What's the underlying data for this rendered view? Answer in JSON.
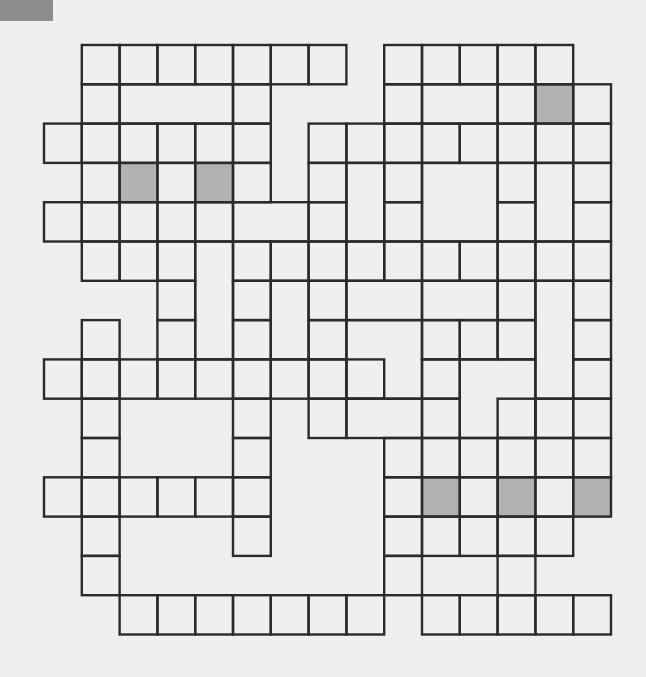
{
  "puzzle": {
    "type": "crossword-grid",
    "origin": [
      44,
      45
    ],
    "cell_w": 37.8,
    "cell_h": 39.3,
    "colors": {
      "background": "#efefed",
      "cell": "#efefed",
      "shaded": "#b2b2b2",
      "line": "#2b2b2b",
      "corner_block": "#8d8d8d"
    },
    "boxes": [
      [
        1,
        0
      ],
      [
        2,
        0
      ],
      [
        3,
        0
      ],
      [
        4,
        0
      ],
      [
        5,
        0
      ],
      [
        6,
        0
      ],
      [
        7,
        0
      ],
      [
        9,
        0
      ],
      [
        10,
        0
      ],
      [
        11,
        0
      ],
      [
        12,
        0
      ],
      [
        13,
        0
      ],
      [
        1,
        1
      ],
      [
        2,
        1,
        3,
        1
      ],
      [
        5,
        1
      ],
      [
        9,
        1
      ],
      [
        10,
        1,
        2,
        1
      ],
      [
        12,
        1
      ],
      [
        13,
        1
      ],
      [
        14,
        1
      ],
      [
        0,
        2
      ],
      [
        1,
        2
      ],
      [
        2,
        2
      ],
      [
        3,
        2
      ],
      [
        4,
        2
      ],
      [
        5,
        2
      ],
      [
        7,
        2
      ],
      [
        8,
        2
      ],
      [
        9,
        2
      ],
      [
        10,
        2
      ],
      [
        11,
        2
      ],
      [
        12,
        2
      ],
      [
        13,
        2
      ],
      [
        14,
        2
      ],
      [
        1,
        3
      ],
      [
        2,
        3
      ],
      [
        3,
        3
      ],
      [
        4,
        3
      ],
      [
        5,
        3
      ],
      [
        7,
        3
      ],
      [
        8,
        3,
        1,
        2
      ],
      [
        9,
        3
      ],
      [
        10,
        3,
        2,
        2
      ],
      [
        12,
        3
      ],
      [
        13,
        3,
        1,
        2
      ],
      [
        14,
        3
      ],
      [
        0,
        4
      ],
      [
        1,
        4
      ],
      [
        2,
        4
      ],
      [
        3,
        4
      ],
      [
        4,
        4
      ],
      [
        5,
        4,
        2,
        1
      ],
      [
        7,
        4
      ],
      [
        9,
        4
      ],
      [
        12,
        4
      ],
      [
        14,
        4
      ],
      [
        1,
        5
      ],
      [
        2,
        5
      ],
      [
        3,
        5
      ],
      [
        4,
        5,
        1,
        3
      ],
      [
        5,
        5
      ],
      [
        6,
        5
      ],
      [
        7,
        5
      ],
      [
        8,
        5
      ],
      [
        9,
        5
      ],
      [
        10,
        5
      ],
      [
        11,
        5
      ],
      [
        12,
        5
      ],
      [
        13,
        5
      ],
      [
        14,
        5
      ],
      [
        3,
        6
      ],
      [
        5,
        6
      ],
      [
        6,
        6,
        1,
        2
      ],
      [
        7,
        6
      ],
      [
        8,
        6,
        2,
        1
      ],
      [
        10,
        6,
        2,
        1
      ],
      [
        12,
        6
      ],
      [
        13,
        6,
        1,
        3
      ],
      [
        14,
        6
      ],
      [
        1,
        7
      ],
      [
        3,
        7
      ],
      [
        5,
        7
      ],
      [
        7,
        7
      ],
      [
        8,
        7,
        2,
        2
      ],
      [
        10,
        7
      ],
      [
        11,
        7
      ],
      [
        12,
        7
      ],
      [
        14,
        7
      ],
      [
        0,
        8
      ],
      [
        1,
        8
      ],
      [
        2,
        8
      ],
      [
        3,
        8
      ],
      [
        4,
        8
      ],
      [
        5,
        8
      ],
      [
        6,
        8
      ],
      [
        7,
        8
      ],
      [
        8,
        8
      ],
      [
        10,
        8
      ],
      [
        11,
        8,
        2,
        2
      ],
      [
        14,
        8
      ],
      [
        1,
        9
      ],
      [
        5,
        9
      ],
      [
        7,
        9
      ],
      [
        8,
        9,
        2,
        1
      ],
      [
        10,
        9
      ],
      [
        12,
        9
      ],
      [
        13,
        9
      ],
      [
        14,
        9
      ],
      [
        1,
        10
      ],
      [
        5,
        10
      ],
      [
        9,
        10
      ],
      [
        10,
        10
      ],
      [
        11,
        10
      ],
      [
        12,
        10
      ],
      [
        13,
        10
      ],
      [
        14,
        10
      ],
      [
        0,
        11
      ],
      [
        1,
        11
      ],
      [
        2,
        11
      ],
      [
        3,
        11
      ],
      [
        4,
        11
      ],
      [
        5,
        11
      ],
      [
        9,
        11
      ],
      [
        10,
        11
      ],
      [
        11,
        11
      ],
      [
        12,
        11
      ],
      [
        13,
        11
      ],
      [
        14,
        11
      ],
      [
        1,
        12
      ],
      [
        5,
        12
      ],
      [
        9,
        12
      ],
      [
        10,
        12
      ],
      [
        11,
        12
      ],
      [
        12,
        12
      ],
      [
        13,
        12
      ],
      [
        1,
        13
      ],
      [
        9,
        13
      ],
      [
        12,
        13
      ],
      [
        2,
        14
      ],
      [
        3,
        14
      ],
      [
        4,
        14
      ],
      [
        5,
        14
      ],
      [
        6,
        14
      ],
      [
        7,
        14
      ],
      [
        8,
        14
      ],
      [
        10,
        14
      ],
      [
        11,
        14
      ],
      [
        12,
        14
      ],
      [
        13,
        14
      ],
      [
        14,
        14
      ]
    ],
    "shaded": [
      [
        13,
        1
      ],
      [
        2,
        3
      ],
      [
        4,
        3
      ],
      [
        10,
        11
      ],
      [
        12,
        11
      ],
      [
        14,
        11
      ]
    ]
  }
}
